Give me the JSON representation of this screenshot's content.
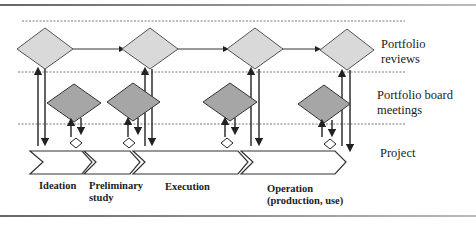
{
  "lanes": [
    {
      "label": "Portfolio reviews",
      "line1": "Portfolio",
      "line2": "reviews"
    },
    {
      "label": "Portfolio board meetings",
      "line1": "Portfolio board",
      "line2": "meetings"
    },
    {
      "label": "Project",
      "line1": "Project"
    }
  ],
  "phases": [
    {
      "label": "Ideation",
      "line1": "Ideation"
    },
    {
      "label": "Preliminary study",
      "line1": "Preliminary",
      "line2": "study"
    },
    {
      "label": "Execution",
      "line1": "Execution"
    },
    {
      "label": "Operation (production, use)",
      "line1": "Operation",
      "line2": "(production, use)"
    }
  ],
  "colors": {
    "review_diamond_fill": "#d9d9d9",
    "board_diamond_fill": "#a6a6a6",
    "stroke": "#333333",
    "dashed_line": "#555555",
    "gate_diamond_fill": "#ffffff"
  }
}
